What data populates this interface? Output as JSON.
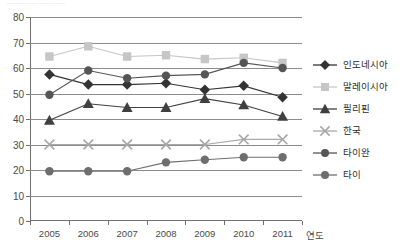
{
  "header": {
    "clipped_text": "———  ——  ——  ——"
  },
  "axes": {
    "x_axis_title": "연도",
    "y_ticks": [
      "80",
      "70",
      "60",
      "50",
      "40",
      "30",
      "20",
      "10",
      "0"
    ],
    "x_ticks": [
      "2005",
      "2006",
      "2007",
      "2008",
      "2009",
      "2010",
      "2011"
    ]
  },
  "legend": {
    "items": [
      {
        "label": "인도네시아",
        "marker": "diamond",
        "color": "#333333"
      },
      {
        "label": "말레이시아",
        "marker": "square",
        "color": "#c6c6c6"
      },
      {
        "label": "필리핀",
        "marker": "triangle",
        "color": "#404040"
      },
      {
        "label": "한국",
        "marker": "cross",
        "color": "#a8a8a8"
      },
      {
        "label": "타이완",
        "marker": "circle",
        "color": "#555555"
      },
      {
        "label": "타이",
        "marker": "circle",
        "color": "#6e6e6e"
      }
    ]
  },
  "chart_data": {
    "type": "line",
    "title": "",
    "xlabel": "연도",
    "ylabel": "",
    "categories": [
      "2005",
      "2006",
      "2007",
      "2008",
      "2009",
      "2010",
      "2011"
    ],
    "ylim": [
      0,
      80
    ],
    "ytick_step": 10,
    "grid": true,
    "legend_position": "right",
    "series": [
      {
        "name": "인도네시아",
        "marker": "diamond",
        "color": "#333333",
        "values": [
          57.5,
          53.5,
          53.5,
          54.0,
          51.5,
          53.0,
          48.5
        ]
      },
      {
        "name": "말레이시아",
        "marker": "square",
        "color": "#c6c6c6",
        "values": [
          64.5,
          68.5,
          64.5,
          65.0,
          63.5,
          64.0,
          62.0
        ]
      },
      {
        "name": "필리핀",
        "marker": "triangle",
        "color": "#404040",
        "values": [
          39.5,
          46.0,
          44.5,
          44.5,
          48.0,
          45.5,
          41.0
        ]
      },
      {
        "name": "한국",
        "marker": "cross",
        "color": "#a8a8a8",
        "values": [
          30.0,
          30.0,
          30.0,
          30.0,
          30.0,
          32.0,
          32.0
        ]
      },
      {
        "name": "타이완",
        "marker": "circle",
        "color": "#555555",
        "values": [
          49.5,
          59.0,
          56.0,
          57.0,
          57.5,
          62.0,
          60.0
        ]
      },
      {
        "name": "타이",
        "marker": "circle",
        "color": "#6e6e6e",
        "values": [
          19.5,
          19.5,
          19.5,
          23.0,
          24.0,
          25.0,
          25.0
        ]
      }
    ]
  }
}
